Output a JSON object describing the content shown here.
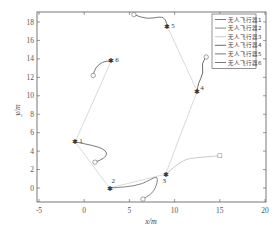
{
  "chart_data": {
    "type": "line",
    "title": "",
    "xlabel": "x/m",
    "ylabel": "y/m",
    "xlim": [
      -5,
      20
    ],
    "ylim": [
      -1.5,
      19
    ],
    "xticks": [
      -5,
      0,
      5,
      10,
      15,
      20
    ],
    "yticks": [
      0,
      2,
      4,
      6,
      8,
      10,
      12,
      14,
      16,
      18
    ],
    "grid": false,
    "legend_position": "upper right",
    "series": [
      {
        "name": "无人飞行器1",
        "color": "#555555",
        "start": [
          1.2,
          2.8
        ],
        "end": [
          -1.0,
          5.0
        ],
        "path": [
          [
            1.2,
            2.8
          ],
          [
            2.2,
            3.2
          ],
          [
            2.6,
            3.8
          ],
          [
            2.0,
            4.3
          ],
          [
            1.0,
            4.6
          ],
          [
            -1.0,
            5.0
          ]
        ]
      },
      {
        "name": "无人飞行器2",
        "color": "#666666",
        "start": [
          6.5,
          -1.2
        ],
        "end": [
          2.8,
          0.0
        ],
        "path": [
          [
            6.5,
            -1.2
          ],
          [
            7.8,
            -0.4
          ],
          [
            8.3,
            1.5
          ],
          [
            6.5,
            0.4
          ],
          [
            4.5,
            0.1
          ],
          [
            2.8,
            0.0
          ]
        ]
      },
      {
        "name": "无人飞行器3",
        "color": "#bbbbbb",
        "start": [
          15.0,
          3.5
        ],
        "end": [
          9.0,
          1.5
        ],
        "path": [
          [
            15.0,
            3.5
          ],
          [
            12.5,
            3.3
          ],
          [
            11.0,
            3.1
          ],
          [
            9.0,
            1.5
          ]
        ]
      },
      {
        "name": "无人飞行器4",
        "color": "#444444",
        "start": [
          13.5,
          14.2
        ],
        "end": [
          12.5,
          10.5
        ],
        "path": [
          [
            13.5,
            14.2
          ],
          [
            13.0,
            13.5
          ],
          [
            13.2,
            12.5
          ],
          [
            12.6,
            11.3
          ],
          [
            12.5,
            10.5
          ]
        ]
      },
      {
        "name": "无人飞行器5",
        "color": "#555555",
        "start": [
          5.5,
          18.8
        ],
        "end": [
          9.2,
          17.5
        ],
        "path": [
          [
            5.5,
            18.8
          ],
          [
            7.0,
            18.3
          ],
          [
            8.5,
            18.6
          ],
          [
            9.0,
            18.3
          ],
          [
            9.2,
            17.5
          ]
        ]
      },
      {
        "name": "无人飞行器6",
        "color": "#555555",
        "start": [
          1.0,
          12.2
        ],
        "end": [
          3.0,
          13.8
        ],
        "path": [
          [
            1.0,
            12.2
          ],
          [
            1.2,
            13.0
          ],
          [
            2.0,
            13.7
          ],
          [
            3.0,
            13.8
          ]
        ]
      }
    ],
    "formation_links": [
      {
        "from": "1",
        "to": "2",
        "color": "#c8c8c8"
      },
      {
        "from": "2",
        "to": "3",
        "color": "#c8c8c8"
      },
      {
        "from": "3",
        "to": "4",
        "color": "#c8c8c8"
      },
      {
        "from": "4",
        "to": "5",
        "color": "#c8c8c8"
      },
      {
        "from": "1",
        "to": "6",
        "color": "#c8c8c8"
      }
    ],
    "annotations": [
      {
        "text": "1",
        "x": -1.0,
        "y": 5.0
      },
      {
        "text": "2",
        "x": 2.8,
        "y": 0.0
      },
      {
        "text": "3",
        "x": 9.0,
        "y": 1.5
      },
      {
        "text": "4",
        "x": 12.5,
        "y": 10.5
      },
      {
        "text": "5",
        "x": 9.2,
        "y": 17.5
      },
      {
        "text": "6",
        "x": 3.0,
        "y": 13.8
      }
    ]
  }
}
